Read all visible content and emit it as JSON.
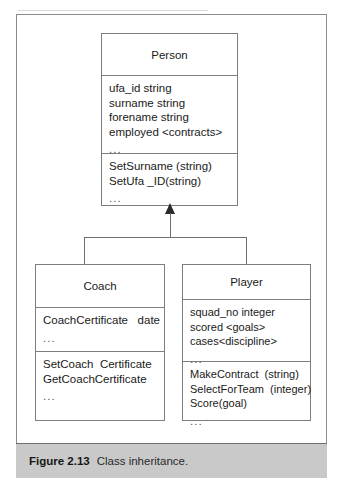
{
  "figure": {
    "caption_number": "Figure 2.13",
    "caption_text": "Class inheritance.",
    "caption_bar_color": "#c9c9c9",
    "frame_border_color": "#8c8c8c"
  },
  "diagram": {
    "type": "uml-class-inheritance",
    "relationship": "generalization",
    "parent": "Person",
    "children": [
      "Coach",
      "Player"
    ],
    "arrowhead": "filled-triangle",
    "classes": [
      {
        "name": "Person",
        "attributes": [
          "ufa_id string",
          "surname string",
          "forename string",
          "employed <contracts>"
        ],
        "attributes_ellipsis": "...",
        "operations": [
          "SetSurname (string)",
          "SetUfa _ID(string)"
        ],
        "operations_ellipsis": "..."
      },
      {
        "name": "Coach",
        "attributes": [
          "CoachCertificate   date"
        ],
        "attributes_ellipsis": "...",
        "operations": [
          "SetCoach  Certificate",
          "GetCoachCertificate"
        ],
        "operations_ellipsis": "..."
      },
      {
        "name": "Player",
        "attributes": [
          "squad_no integer",
          "scored <goals>",
          "cases<discipline>"
        ],
        "attributes_ellipsis": "...",
        "operations": [
          "MakeContract  (string)",
          "SelectForTeam  (integer)",
          "Score(goal)"
        ],
        "operations_ellipsis": "..."
      }
    ]
  }
}
